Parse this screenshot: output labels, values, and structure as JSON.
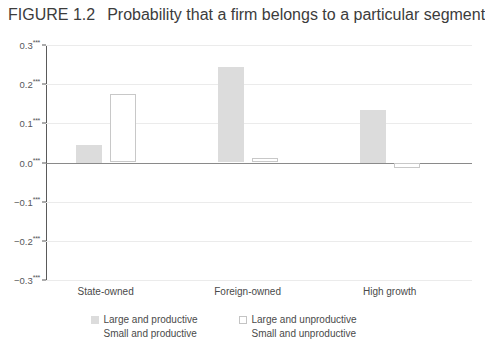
{
  "figure": {
    "number": "FIGURE 1.2",
    "title": "Probability that a firm belongs to a particular segment"
  },
  "chart_data": {
    "type": "bar",
    "title": "Probability that a firm belongs to a particular segment",
    "xlabel": "",
    "ylabel": "",
    "ylim": [
      -0.3,
      0.3
    ],
    "grid": true,
    "legend_position": "bottom",
    "categories": [
      "State-owned",
      "Foreign-owned",
      "High growth"
    ],
    "ytick_labels": [
      "0.3***",
      "0.2***",
      "0.1***",
      "0.0***",
      "−0.1***",
      "−0.2***",
      "−0.3***"
    ],
    "ytick_values": [
      0.3,
      0.2,
      0.1,
      0.0,
      -0.1,
      -0.2,
      -0.3
    ],
    "series": [
      {
        "name": "Large and productive",
        "style": "filled",
        "color": "#dcdcdc",
        "values": [
          0.045,
          0.245,
          0.135
        ]
      },
      {
        "name": "Large and unproductive",
        "style": "outlined",
        "color": "#ffffff",
        "values": [
          0.175,
          0.012,
          -0.015
        ]
      }
    ],
    "legend_entries": [
      {
        "label": "Large and productive",
        "style": "filled"
      },
      {
        "label": "Large and unproductive",
        "style": "outlined"
      },
      {
        "label": "Small and productive",
        "style": "hidden"
      },
      {
        "label": "Small and unproductive",
        "style": "hidden"
      }
    ]
  }
}
